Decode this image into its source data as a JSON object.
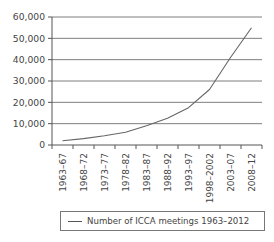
{
  "chart_data": {
    "type": "line",
    "title": "",
    "xlabel": "",
    "ylabel": "",
    "categories": [
      "1963–67",
      "1968–72",
      "1973–77",
      "1978–82",
      "1983–87",
      "1988–92",
      "1993–97",
      "1998–2002",
      "2003–07",
      "2008–12"
    ],
    "series": [
      {
        "name": "Number of ICCA meetings 1963–2012",
        "values": [
          2000,
          3000,
          4300,
          6000,
          9000,
          12500,
          17500,
          26000,
          41000,
          55000
        ]
      }
    ],
    "ylim": [
      0,
      60000
    ],
    "yticks": [
      0,
      10000,
      20000,
      30000,
      40000,
      50000,
      60000
    ],
    "ytick_labels": [
      "0",
      "10,000",
      "20,000",
      "30,000",
      "40,000",
      "50,000",
      "60,000"
    ],
    "grid": true,
    "legend_position": "bottom"
  },
  "colors": {
    "line": "#666666",
    "grid": "#6f6f6f",
    "axis": "#555555",
    "text": "#444444"
  },
  "legend": {
    "label": "Number of ICCA meetings 1963–2012"
  }
}
